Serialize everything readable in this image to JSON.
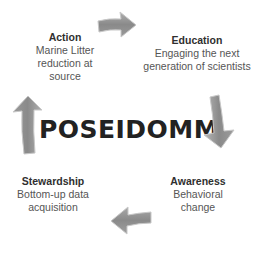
{
  "center": {
    "title": "POSEIDOMM"
  },
  "blocks": {
    "action": {
      "title": "Action",
      "desc_lines": [
        "Marine Litter",
        "reduction at",
        "source"
      ]
    },
    "education": {
      "title": "Education",
      "desc_lines": [
        "Engaging the next",
        "generation of scientists"
      ]
    },
    "awareness": {
      "title": "Awareness",
      "desc_lines": [
        "Behavioral",
        "change"
      ]
    },
    "stewardship": {
      "title": "Stewardship",
      "desc_lines": [
        "Bottom-up data",
        "acquisition"
      ]
    }
  },
  "arrows": [
    {
      "name": "arrow-right",
      "direction": "right",
      "color": "#8c8c8c"
    },
    {
      "name": "arrow-down",
      "direction": "down",
      "color": "#8c8c8c"
    },
    {
      "name": "arrow-left",
      "direction": "left",
      "color": "#8c8c8c"
    },
    {
      "name": "arrow-up",
      "direction": "up",
      "color": "#8c8c8c"
    }
  ],
  "colors": {
    "arrow_fill": "#8c8c8c",
    "arrow_edge": "#b5b5b5",
    "title_text": "#222222",
    "body_text": "#555555"
  }
}
